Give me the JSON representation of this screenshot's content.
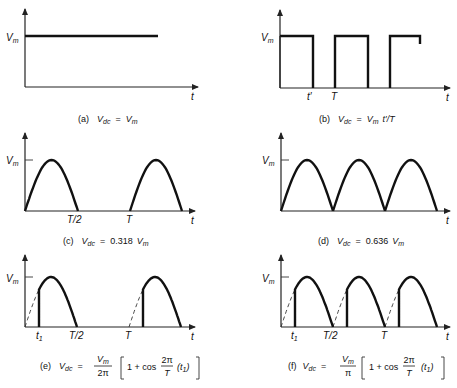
{
  "figure": {
    "y_label": "V",
    "y_label_sub": "m",
    "x_label": "t"
  },
  "panels": [
    {
      "id": "a",
      "tag": "(a)",
      "waveform": "dc",
      "tick_labels": [],
      "caption": {
        "lhs": "V",
        "lhs_sub": "dc",
        "eq": "=",
        "rhs": "V",
        "rhs_sub": "m"
      }
    },
    {
      "id": "b",
      "tag": "(b)",
      "waveform": "rectangular-pulse",
      "tick_labels": [
        "t′",
        "T"
      ],
      "caption": {
        "lhs": "V",
        "lhs_sub": "dc",
        "eq": "=",
        "rhs": "V",
        "rhs_sub": "m",
        "rhs_tail": "t′/T"
      }
    },
    {
      "id": "c",
      "tag": "(c)",
      "waveform": "half-wave-rectified-sine",
      "tick_labels": [
        "T/2",
        "T"
      ],
      "caption": {
        "lhs": "V",
        "lhs_sub": "dc",
        "eq": "=",
        "coef": "0.318",
        "rhs": "V",
        "rhs_sub": "m"
      }
    },
    {
      "id": "d",
      "tag": "(d)",
      "waveform": "full-wave-rectified-sine",
      "tick_labels": [],
      "caption": {
        "lhs": "V",
        "lhs_sub": "dc",
        "eq": "=",
        "coef": "0.636",
        "rhs": "V",
        "rhs_sub": "m"
      }
    },
    {
      "id": "e",
      "tag": "(e)",
      "waveform": "phase-controlled-half-wave",
      "tick_labels": [
        "t",
        "T/2",
        "T"
      ],
      "tick_t1_sub": "1",
      "caption": {
        "lhs": "V",
        "lhs_sub": "dc",
        "eq": "=",
        "num": "V",
        "num_sub": "m",
        "den": "2π",
        "bracket": "1 + cos",
        "frac_num": "2π",
        "frac_den": "T",
        "arg": "(t",
        "arg_sub": "1",
        "arg_close": ")"
      }
    },
    {
      "id": "f",
      "tag": "(f)",
      "waveform": "phase-controlled-full-wave",
      "tick_labels": [
        "t",
        "T/2",
        "T"
      ],
      "tick_t1_sub": "1",
      "caption": {
        "lhs": "V",
        "lhs_sub": "dc",
        "eq": "=",
        "num": "V",
        "num_sub": "m",
        "den": "π",
        "bracket": "1 + cos",
        "frac_num": "2π",
        "frac_den": "T",
        "arg": "(t",
        "arg_sub": "1",
        "arg_close": ")"
      }
    }
  ],
  "chart_data": [
    {
      "type": "line",
      "title": "(a) Vdc = Vm",
      "xlabel": "t",
      "ylabel": "Vm",
      "description": "constant DC level at Vm"
    },
    {
      "type": "line",
      "title": "(b) Vdc = Vm t'/T",
      "xlabel": "t",
      "ylabel": "Vm",
      "description": "rectangular pulses of height Vm, width t', period T",
      "x_ticks": [
        "t'",
        "T"
      ]
    },
    {
      "type": "line",
      "title": "(c) Vdc = 0.318 Vm",
      "xlabel": "t",
      "ylabel": "Vm",
      "description": "half-wave rectified sine",
      "x_ticks": [
        "T/2",
        "T"
      ]
    },
    {
      "type": "line",
      "title": "(d) Vdc = 0.636 Vm",
      "xlabel": "t",
      "ylabel": "Vm",
      "description": "full-wave rectified sine"
    },
    {
      "type": "line",
      "title": "(e) Vdc = Vm/2π [1 + cos(2π/T)(t1)]",
      "xlabel": "t",
      "ylabel": "Vm",
      "description": "phase-controlled half-wave, conduction starts at t1",
      "x_ticks": [
        "t1",
        "T/2",
        "T"
      ]
    },
    {
      "type": "line",
      "title": "(f) Vdc = Vm/π [1 + cos(2π/T)(t1)]",
      "xlabel": "t",
      "ylabel": "Vm",
      "description": "phase-controlled full-wave, conduction starts at t1 each half-cycle",
      "x_ticks": [
        "t1",
        "T/2",
        "T"
      ]
    }
  ]
}
